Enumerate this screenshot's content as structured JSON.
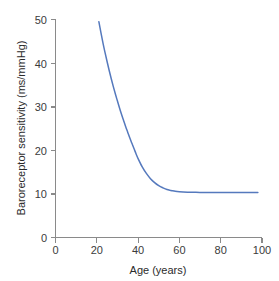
{
  "chart_data": {
    "type": "line",
    "title": "",
    "xlabel": "Age (years)",
    "ylabel": "Baroreceptor sensitivity (ms/mmHg)",
    "xlim": [
      0,
      100
    ],
    "ylim": [
      0,
      50
    ],
    "xticks": [
      0,
      20,
      40,
      60,
      80,
      100
    ],
    "yticks": [
      0,
      10,
      20,
      30,
      40,
      50
    ],
    "xtick_labels": [
      "0",
      "20",
      "40",
      "60",
      "80",
      "100"
    ],
    "ytick_labels": [
      "0",
      "10",
      "20",
      "30",
      "40",
      "50"
    ],
    "grid": false,
    "legend": null,
    "series": [
      {
        "name": "Baroreceptor sensitivity",
        "color": "#5579bd",
        "x": [
          21,
          22,
          23,
          24,
          25,
          26,
          27,
          28,
          29,
          30,
          31,
          32,
          33,
          34,
          35,
          36,
          37,
          38,
          39,
          40,
          42,
          44,
          46,
          48,
          50,
          52,
          54,
          56,
          58,
          60,
          64,
          68,
          72,
          76,
          80,
          85,
          90,
          94,
          98
        ],
        "values": [
          49.5,
          47.0,
          44.6,
          42.4,
          40.3,
          38.3,
          36.4,
          34.6,
          32.9,
          31.3,
          29.7,
          28.2,
          26.8,
          25.4,
          24.1,
          22.8,
          21.6,
          20.4,
          19.2,
          18.1,
          16.2,
          14.7,
          13.5,
          12.6,
          11.9,
          11.4,
          11.0,
          10.8,
          10.6,
          10.5,
          10.4,
          10.35,
          10.33,
          10.32,
          10.31,
          10.3,
          10.3,
          10.3,
          10.3
        ]
      }
    ]
  },
  "axes": {
    "y_axis_title": "Baroreceptor sensitivity (ms/mmHg)",
    "x_axis_title": "Age (years)"
  },
  "colors": {
    "curve": "#5579bd",
    "axis": "#8a8a8a",
    "text": "#2b2b2b",
    "background": "#ffffff"
  }
}
